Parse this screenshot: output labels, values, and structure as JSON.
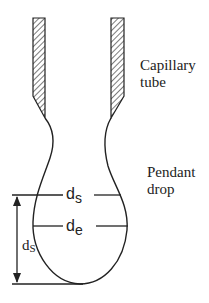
{
  "diagram": {
    "labels": {
      "capillary_line1": "Capillary",
      "capillary_line2": "tube",
      "pendant_line1": "Pendant",
      "pendant_line2": "drop"
    },
    "measurements": {
      "ds_horizontal": {
        "base": "d",
        "sub": "s"
      },
      "de_horizontal": {
        "base": "d",
        "sub": "e"
      },
      "ds_vertical": {
        "base": "d",
        "sub": "S"
      }
    },
    "colors": {
      "stroke": "#222222",
      "background": "#ffffff"
    }
  }
}
